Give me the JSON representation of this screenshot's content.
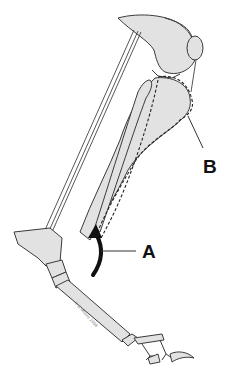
{
  "figure": {
    "labels": [
      {
        "id": "A",
        "text": "A",
        "points_to": "curved flexion arrow at hock"
      },
      {
        "id": "B",
        "text": "B",
        "points_to": "dashed muscle outline behind tibia"
      }
    ],
    "copyright": "© B Moore 1998",
    "colors": {
      "bone_fill": "#e2e2e2",
      "line": "#3a3a3a",
      "arrow": "#111111",
      "background": "#ffffff"
    }
  }
}
